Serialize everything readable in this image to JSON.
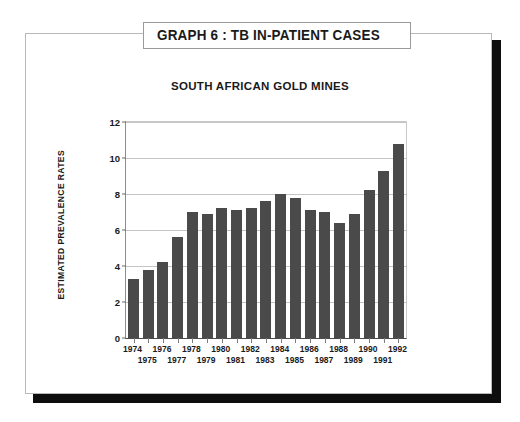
{
  "poster": {
    "title": "GRAPH 6 : TB IN-PATIENT CASES"
  },
  "chart_data": {
    "type": "bar",
    "title": "SOUTH AFRICAN GOLD MINES",
    "xlabel": "",
    "ylabel": "ESTIMATED PREVALENCE RATES",
    "categories": [
      "1974",
      "1975",
      "1976",
      "1977",
      "1978",
      "1979",
      "1980",
      "1981",
      "1982",
      "1983",
      "1984",
      "1985",
      "1986",
      "1987",
      "1988",
      "1989",
      "1990",
      "1991",
      "1992"
    ],
    "values": [
      3.3,
      3.8,
      4.2,
      5.6,
      7.0,
      6.9,
      7.2,
      7.1,
      7.2,
      7.6,
      8.0,
      7.8,
      7.1,
      7.0,
      6.4,
      6.9,
      8.2,
      9.3,
      10.8
    ],
    "ylim": [
      0,
      12
    ],
    "yticks": [
      0,
      2,
      4,
      6,
      8,
      10,
      12
    ],
    "grid": true,
    "legend": "none",
    "bar_color": "#4a4a4a",
    "grid_color": "#c4c4c4",
    "axis_color": "#4a4a4a"
  }
}
